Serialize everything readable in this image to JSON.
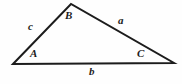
{
  "figure": {
    "kind": "geometry-diagram",
    "shape": "triangle",
    "background_color": "#fefefe",
    "stroke_color": "#1c1c1c",
    "stroke_width": 2,
    "width": 182,
    "height": 84
  },
  "vertices": [
    {
      "id": "A",
      "label": "A",
      "x": 13,
      "y": 64
    },
    {
      "id": "B",
      "label": "B",
      "x": 71,
      "y": 4
    },
    {
      "id": "C",
      "label": "C",
      "x": 174,
      "y": 63
    }
  ],
  "sides": [
    {
      "id": "a",
      "label": "a",
      "between": "B-C"
    },
    {
      "id": "b",
      "label": "b",
      "between": "A-C"
    },
    {
      "id": "c",
      "label": "c",
      "between": "A-B"
    }
  ]
}
